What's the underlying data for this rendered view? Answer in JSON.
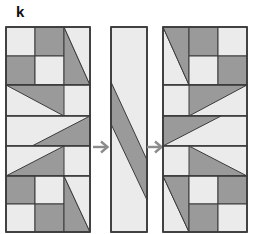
{
  "figure": {
    "label": "k",
    "type": "quilt-block-transformation-diagram",
    "width": 253,
    "height": 234
  },
  "colors": {
    "light": "#ebebeb",
    "dark": "#9a9a9a",
    "outline": "#3b3b3b",
    "background": "#ffffff",
    "arrow": "#8c8c8c",
    "label_text": "#111111"
  },
  "geometry": {
    "stage_top": 26,
    "panel_height": 205,
    "side_panel_width": 84,
    "middle_panel_width": 36
  },
  "arrows": [
    {
      "name": "arrow-one",
      "glyph": "→",
      "direction": "right"
    },
    {
      "name": "arrow-two",
      "glyph": "→",
      "direction": "right"
    }
  ],
  "panels": [
    {
      "id": "left",
      "title": "left-quilt-panel",
      "width": 84,
      "height": 205,
      "bands": [
        {
          "name": "four-patch-with-triangle-top",
          "y": 0,
          "height": 58,
          "shapes": [
            {
              "shape": "rect",
              "fill": "light",
              "points": "0,0 29,0 29,29 0,29"
            },
            {
              "shape": "rect",
              "fill": "dark",
              "points": "29,0 58,0 58,29 29,29"
            },
            {
              "shape": "rect",
              "fill": "dark",
              "points": "0,29 29,29 29,58 0,58"
            },
            {
              "shape": "rect",
              "fill": "light",
              "points": "29,29 58,29 58,58 29,58"
            },
            {
              "shape": "triangle",
              "fill": "dark",
              "points": "58,0 58,58 84,58"
            },
            {
              "shape": "triangle",
              "fill": "light",
              "points": "58,0 84,0 84,58"
            }
          ]
        },
        {
          "name": "right-pointing-triangle-band",
          "y": 58,
          "height": 31,
          "shapes": [
            {
              "shape": "rect",
              "fill": "light",
              "points": "0,0 84,0 84,31 0,31"
            },
            {
              "shape": "triangle",
              "fill": "dark",
              "points": "0,0 58,0 58,31"
            }
          ]
        },
        {
          "name": "lower-right-triangle-band",
          "y": 89,
          "height": 30,
          "shapes": [
            {
              "shape": "rect",
              "fill": "light",
              "points": "0,0 84,0 84,30 0,30"
            },
            {
              "shape": "triangle",
              "fill": "dark",
              "points": "84,0 84,30 26,30"
            }
          ]
        },
        {
          "name": "upper-right-triangle-band",
          "y": 119,
          "height": 30,
          "shapes": [
            {
              "shape": "rect",
              "fill": "light",
              "points": "0,0 84,0 84,30 0,30"
            },
            {
              "shape": "triangle",
              "fill": "dark",
              "points": "58,0 58,30 0,30"
            }
          ]
        },
        {
          "name": "four-patch-with-triangle-bottom",
          "y": 149,
          "height": 56,
          "shapes": [
            {
              "shape": "rect",
              "fill": "dark",
              "points": "0,0 29,0 29,28 0,28"
            },
            {
              "shape": "rect",
              "fill": "light",
              "points": "29,0 58,0 58,28 29,28"
            },
            {
              "shape": "rect",
              "fill": "light",
              "points": "0,28 29,28 29,56 0,56"
            },
            {
              "shape": "rect",
              "fill": "dark",
              "points": "29,28 58,28 58,56 29,56"
            },
            {
              "shape": "triangle",
              "fill": "dark",
              "points": "58,0 58,56 84,56"
            },
            {
              "shape": "triangle",
              "fill": "light",
              "points": "58,0 84,0 84,56"
            }
          ]
        }
      ]
    },
    {
      "id": "middle",
      "title": "middle-strip-panel",
      "width": 36,
      "height": 205,
      "bands": [
        {
          "name": "zigzag-strip",
          "y": 0,
          "height": 205,
          "shapes": [
            {
              "shape": "rect",
              "fill": "light",
              "points": "0,0 36,0 36,205 0,205"
            },
            {
              "shape": "polygon",
              "fill": "dark",
              "points": "0,55 36,133 36,173 0,97"
            }
          ]
        }
      ]
    },
    {
      "id": "right",
      "title": "right-quilt-panel",
      "width": 84,
      "height": 205,
      "bands": [
        {
          "name": "triangle-with-four-patch-top",
          "y": 0,
          "height": 58,
          "shapes": [
            {
              "shape": "triangle",
              "fill": "light",
              "points": "0,0 0,58 26,58"
            },
            {
              "shape": "triangle",
              "fill": "dark",
              "points": "0,0 26,0 26,58"
            },
            {
              "shape": "rect",
              "fill": "dark",
              "points": "26,0 55,0 55,29 26,29"
            },
            {
              "shape": "rect",
              "fill": "light",
              "points": "55,0 84,0 84,29 55,29"
            },
            {
              "shape": "rect",
              "fill": "light",
              "points": "26,29 55,29 55,58 26,58"
            },
            {
              "shape": "rect",
              "fill": "dark",
              "points": "55,29 84,29 84,58 55,58"
            }
          ]
        },
        {
          "name": "right-pointing-triangle-band",
          "y": 58,
          "height": 31,
          "shapes": [
            {
              "shape": "rect",
              "fill": "light",
              "points": "0,0 84,0 84,31 0,31"
            },
            {
              "shape": "triangle",
              "fill": "dark",
              "points": "26,0 84,0 26,31"
            }
          ]
        },
        {
          "name": "left-pointing-triangle-band",
          "y": 89,
          "height": 30,
          "shapes": [
            {
              "shape": "rect",
              "fill": "light",
              "points": "0,0 84,0 84,30 0,30"
            },
            {
              "shape": "triangle",
              "fill": "dark",
              "points": "0,0 0,30 58,0"
            }
          ]
        },
        {
          "name": "upper-left-triangle-band",
          "y": 119,
          "height": 30,
          "shapes": [
            {
              "shape": "rect",
              "fill": "light",
              "points": "0,0 84,0 84,30 0,30"
            },
            {
              "shape": "triangle",
              "fill": "dark",
              "points": "26,0 84,30 26,30"
            }
          ]
        },
        {
          "name": "triangle-with-four-patch-bottom",
          "y": 149,
          "height": 56,
          "shapes": [
            {
              "shape": "triangle",
              "fill": "light",
              "points": "0,0 0,56 26,56"
            },
            {
              "shape": "triangle",
              "fill": "dark",
              "points": "0,0 26,0 26,56"
            },
            {
              "shape": "rect",
              "fill": "light",
              "points": "26,0 55,0 55,28 26,28"
            },
            {
              "shape": "rect",
              "fill": "dark",
              "points": "55,0 84,0 84,28 55,28"
            },
            {
              "shape": "rect",
              "fill": "dark",
              "points": "26,28 55,28 55,56 26,56"
            },
            {
              "shape": "rect",
              "fill": "light",
              "points": "55,28 84,28 84,56 55,56"
            }
          ]
        }
      ]
    }
  ]
}
